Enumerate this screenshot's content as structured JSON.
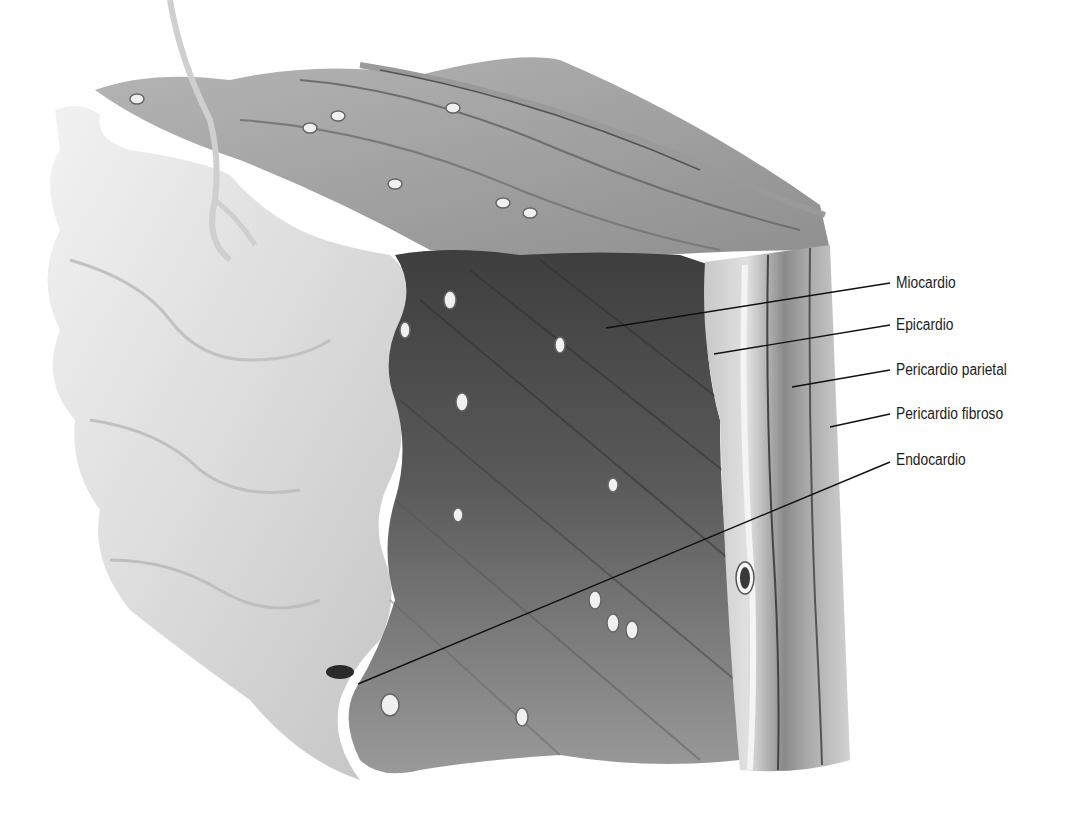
{
  "diagram": {
    "colors": {
      "background": "#ffffff",
      "endocardium_surface": "#e6e6e6",
      "myocardium_dark": "#4a4a4a",
      "myocardium_mid": "#8a8a8a",
      "layer_light": "#cfcfcf",
      "leader_line": "#111111",
      "label_text": "#1c1c1c"
    },
    "labels": [
      {
        "id": "miocardio",
        "text": "Miocardio",
        "x": 896,
        "y": 273,
        "line_from": [
          890,
          283
        ],
        "line_to": [
          606,
          328
        ]
      },
      {
        "id": "epicardio",
        "text": "Epicardio",
        "x": 896,
        "y": 315,
        "line_from": [
          890,
          325
        ],
        "line_to": [
          714,
          354
        ]
      },
      {
        "id": "pericardio-parietal",
        "text": "Pericardio parietal",
        "x": 896,
        "y": 360,
        "line_from": [
          890,
          370
        ],
        "line_to": [
          792,
          387
        ]
      },
      {
        "id": "pericardio-fibroso",
        "text": "Pericardio fibroso",
        "x": 896,
        "y": 404,
        "line_from": [
          890,
          414
        ],
        "line_to": [
          830,
          427
        ]
      },
      {
        "id": "endocardio",
        "text": "Endocardio",
        "x": 896,
        "y": 450,
        "line_from": [
          890,
          462
        ],
        "line_to": [
          358,
          684
        ]
      }
    ]
  }
}
